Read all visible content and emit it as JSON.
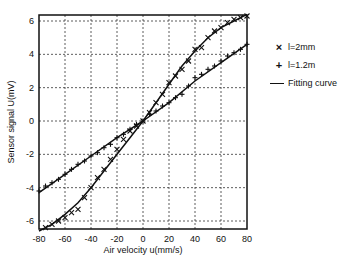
{
  "chart_data": {
    "type": "scatter",
    "title": "",
    "xlabel": "Air velocity u(mm/s)",
    "ylabel": "Sensor signal U(mV)",
    "xlim": [
      -80,
      80
    ],
    "ylim": [
      -6.6,
      6.4
    ],
    "xticks": [
      -80,
      -60,
      -40,
      -20,
      0,
      20,
      40,
      60,
      80
    ],
    "yticks": [
      -6,
      -4,
      -2,
      0,
      2,
      4,
      6
    ],
    "grid": true,
    "legend_position": "right",
    "series": [
      {
        "name": "l=2mm",
        "marker": "x",
        "x": [
          -75,
          -70,
          -65,
          -60,
          -55,
          -50,
          -45,
          -40,
          -35,
          -30,
          -25,
          -20,
          -15,
          -10,
          -5,
          0,
          5,
          10,
          15,
          20,
          25,
          30,
          35,
          40,
          45,
          50,
          55,
          60,
          65,
          70,
          75,
          80
        ],
        "y": [
          -6.4,
          -6.2,
          -6.0,
          -5.8,
          -5.5,
          -5.3,
          -4.6,
          -4.0,
          -3.4,
          -2.9,
          -2.3,
          -1.7,
          -1.1,
          -0.6,
          -0.3,
          0.0,
          0.5,
          1.1,
          1.6,
          2.3,
          2.7,
          3.1,
          3.6,
          4.3,
          4.4,
          5.0,
          5.4,
          5.6,
          5.9,
          6.1,
          6.2,
          6.3
        ]
      },
      {
        "name": "l=1.2m",
        "marker": "+",
        "x": [
          -80,
          -75,
          -70,
          -65,
          -60,
          -55,
          -50,
          -45,
          -40,
          -35,
          -30,
          -25,
          -20,
          -15,
          -10,
          -5,
          0,
          5,
          10,
          15,
          20,
          25,
          30,
          35,
          40,
          45,
          50,
          55,
          60,
          65,
          70,
          75,
          80
        ],
        "y": [
          -4.2,
          -3.9,
          -3.7,
          -3.5,
          -3.2,
          -2.9,
          -2.6,
          -2.4,
          -2.1,
          -1.9,
          -1.6,
          -1.4,
          -1.0,
          -0.8,
          -0.5,
          -0.2,
          0.0,
          0.4,
          0.6,
          0.9,
          1.1,
          1.4,
          1.6,
          2.1,
          2.6,
          2.8,
          3.1,
          3.3,
          3.6,
          3.9,
          4.1,
          4.3,
          4.6
        ]
      },
      {
        "name": "Fitting curve",
        "marker": "line",
        "fits": [
          {
            "for": "l=2mm",
            "x": [
              -80,
              -70,
              -60,
              -50,
              -40,
              -30,
              -20,
              -10,
              0,
              10,
              20,
              30,
              40,
              50,
              60,
              70,
              80
            ],
            "y": [
              -6.6,
              -6.2,
              -5.6,
              -4.9,
              -4.0,
              -3.0,
              -2.0,
              -1.0,
              0.0,
              1.1,
              2.2,
              3.3,
              4.2,
              5.0,
              5.6,
              6.0,
              6.4
            ]
          },
          {
            "for": "l=1.2m",
            "x": [
              -80,
              -60,
              -40,
              -20,
              0,
              20,
              40,
              60,
              80
            ],
            "y": [
              -4.3,
              -3.2,
              -2.1,
              -1.0,
              0.0,
              1.1,
              2.4,
              3.5,
              4.6
            ]
          }
        ]
      }
    ]
  },
  "legend": {
    "items": [
      {
        "symbol": "×",
        "label": "l=2mm"
      },
      {
        "symbol": "+",
        "label": "l=1.2m"
      },
      {
        "symbol": "—",
        "label": "Fitting curve"
      }
    ]
  }
}
